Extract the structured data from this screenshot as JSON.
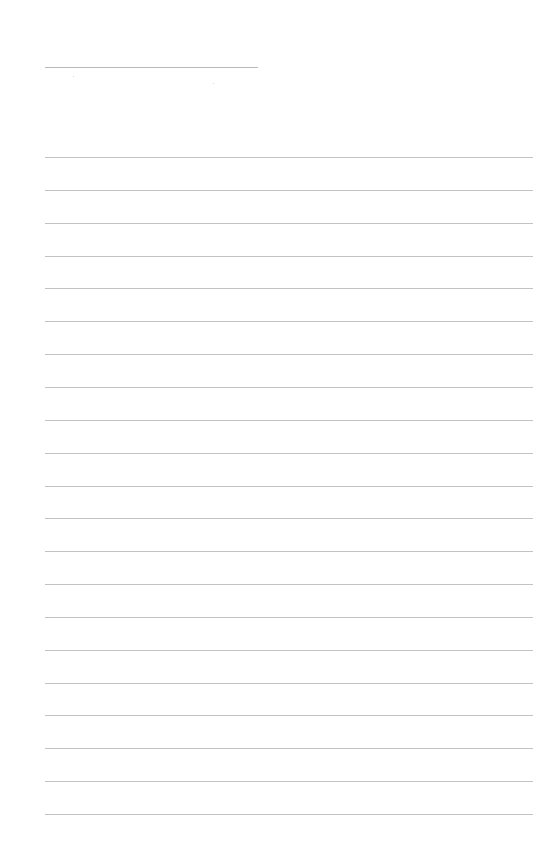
{
  "page": {
    "type": "ruled-notepad-sheet",
    "background_color": "#ffffff",
    "line_color": "#c2c2c2",
    "header_line": {
      "x": 45,
      "y": 67,
      "width": 213,
      "color": "#b8b8b8"
    },
    "rules": {
      "count": 21,
      "start_y": 157,
      "spacing": 32.85,
      "x": 45,
      "width": 488
    },
    "text_content": ""
  }
}
